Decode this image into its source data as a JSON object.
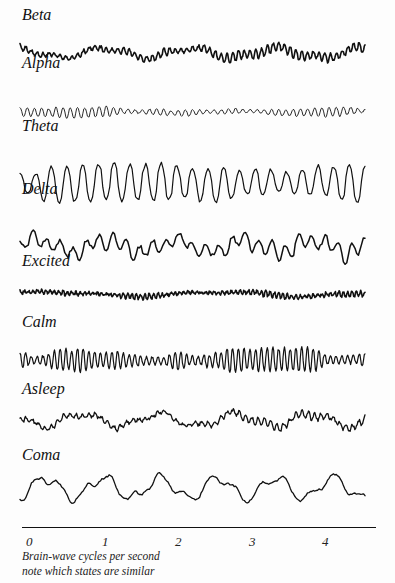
{
  "chart_data": {
    "type": "line",
    "title": "",
    "xlabel": "Brain-wave cycles per second",
    "ylabel": "",
    "annotation": "note which states are similar",
    "x_ticks": [
      "0",
      "1",
      "2",
      "3",
      "4"
    ],
    "xlim": [
      0,
      4.6
    ],
    "grid": false,
    "legend": "none (each trace labelled above it)",
    "series": [
      {
        "name": "Beta",
        "label_top": 6,
        "trace_top": 38,
        "trace_height": 30,
        "amp": 3.2,
        "freq": 60,
        "drift": 4.5,
        "drift_freq": 4,
        "noise": 1.2,
        "stroke": 1.6,
        "seed": 11
      },
      {
        "name": "Alpha",
        "label_top": 54,
        "trace_top": 103,
        "trace_height": 18,
        "amp": 3.5,
        "freq": 48,
        "drift": 0.8,
        "drift_freq": 3,
        "noise": 0.5,
        "stroke": 0.9,
        "seed": 23
      },
      {
        "name": "Theta",
        "label_top": 117,
        "trace_top": 160,
        "trace_height": 46,
        "amp": 13,
        "freq": 22,
        "drift": 1.5,
        "drift_freq": 2,
        "noise": 1.5,
        "stroke": 1.2,
        "seed": 37
      },
      {
        "name": "Delta",
        "label_top": 180,
        "trace_top": 222,
        "trace_height": 48,
        "amp": 6,
        "freq": 26,
        "drift": 6,
        "drift_freq": 5,
        "noise": 2.0,
        "stroke": 1.5,
        "seed": 41
      },
      {
        "name": "Excited",
        "label_top": 252,
        "trace_top": 283,
        "trace_height": 22,
        "amp": 2.0,
        "freq": 80,
        "drift": 2.0,
        "drift_freq": 2,
        "noise": 1.3,
        "stroke": 1.6,
        "seed": 53
      },
      {
        "name": "Calm",
        "label_top": 313,
        "trace_top": 342,
        "trace_height": 36,
        "amp": 8,
        "freq": 60,
        "drift": 0.6,
        "drift_freq": 1,
        "noise": 1.0,
        "stroke": 1.2,
        "seed": 67
      },
      {
        "name": "Asleep",
        "label_top": 380,
        "trace_top": 405,
        "trace_height": 30,
        "amp": 2.5,
        "freq": 55,
        "drift": 6,
        "drift_freq": 4.5,
        "noise": 1.4,
        "stroke": 1.3,
        "seed": 79
      },
      {
        "name": "Coma",
        "label_top": 446,
        "trace_top": 468,
        "trace_height": 40,
        "amp": 1.2,
        "freq": 30,
        "drift": 10,
        "drift_freq": 6,
        "noise": 0.8,
        "stroke": 1.3,
        "seed": 83
      }
    ]
  },
  "labels": {
    "beta": "Beta",
    "alpha": "Alpha",
    "theta": "Theta",
    "delta": "Delta",
    "excited": "Excited",
    "calm": "Calm",
    "asleep": "Asleep",
    "coma": "Coma"
  },
  "axis": {
    "ticks": [
      {
        "label": "0",
        "left": 26
      },
      {
        "label": "1",
        "left": 102
      },
      {
        "label": "2",
        "left": 175
      },
      {
        "label": "3",
        "left": 249
      },
      {
        "label": "4",
        "left": 322
      }
    ],
    "caption_line1": "Brain-wave cycles per second",
    "caption_line2": "note which states are similar"
  }
}
